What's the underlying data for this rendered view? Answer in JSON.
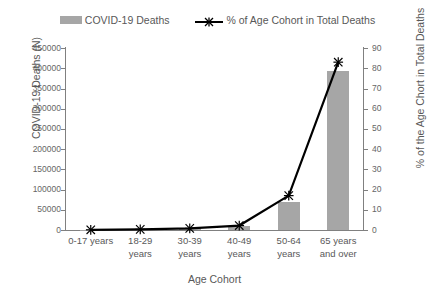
{
  "legend": {
    "items": [
      {
        "label": "COVID-19 Deaths",
        "marker": "bar-swatch",
        "color": "#a6a6a6"
      },
      {
        "label": "% of Age Cohort in Total Deaths",
        "marker": "line-x-swatch",
        "color": "#000000"
      }
    ]
  },
  "axes": {
    "x_title": "Age Cohort",
    "y_left_title": "COVID-19 Deaths (N)",
    "y_right_title": "% of the Age Chort in Total Deaths",
    "y_left_ticks": [
      "0",
      "50000",
      "100000",
      "150000",
      "200000",
      "250000",
      "300000",
      "350000",
      "400000",
      "450000"
    ],
    "y_right_ticks": [
      "0",
      "10",
      "20",
      "30",
      "40",
      "50",
      "60",
      "70",
      "80",
      "90"
    ]
  },
  "chart_data": {
    "type": "bar",
    "title": "",
    "categories": [
      "0-17 years",
      "18-29 years",
      "30-39 years",
      "40-49 years",
      "50-64 years",
      "65 years and over"
    ],
    "series": [
      {
        "name": "COVID-19 Deaths",
        "type": "bar",
        "axis": "left",
        "color": "#a6a6a6",
        "values": [
          400,
          1600,
          4200,
          11000,
          70000,
          393000
        ]
      },
      {
        "name": "% of Age Cohort in Total Deaths",
        "type": "line",
        "axis": "right",
        "color": "#000000",
        "marker": "x",
        "values": [
          0.1,
          0.3,
          0.8,
          2.2,
          17.0,
          83.0
        ]
      }
    ],
    "xlabel": "Age Cohort",
    "ylabel": "COVID-19 Deaths (N)",
    "ylabel_right": "% of the Age Chort in Total Deaths",
    "ylim": [
      0,
      450000
    ],
    "ylim_right": [
      0,
      90
    ],
    "grid": false,
    "legend_position": "top"
  }
}
